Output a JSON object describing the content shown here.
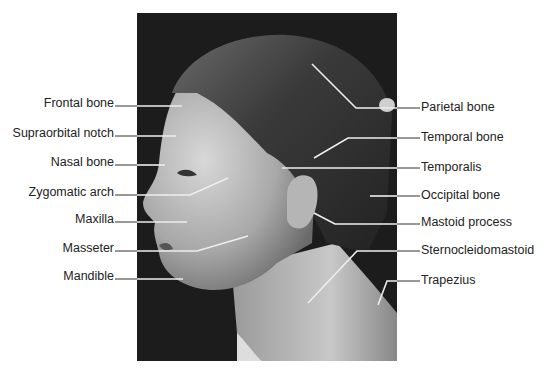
{
  "figure": {
    "labels_left": [
      {
        "text": "Frontal bone"
      },
      {
        "text": "Supraorbital notch"
      },
      {
        "text": "Nasal bone"
      },
      {
        "text": "Zygomatic arch"
      },
      {
        "text": "Maxilla"
      },
      {
        "text": "Masseter"
      },
      {
        "text": "Mandible"
      }
    ],
    "labels_right": [
      {
        "text": "Parietal bone"
      },
      {
        "text": "Temporal bone"
      },
      {
        "text": "Temporalis"
      },
      {
        "text": "Occipital bone"
      },
      {
        "text": "Mastoid process"
      },
      {
        "text": "Sternocleidomastoid"
      },
      {
        "text": "Trapezius"
      }
    ]
  }
}
